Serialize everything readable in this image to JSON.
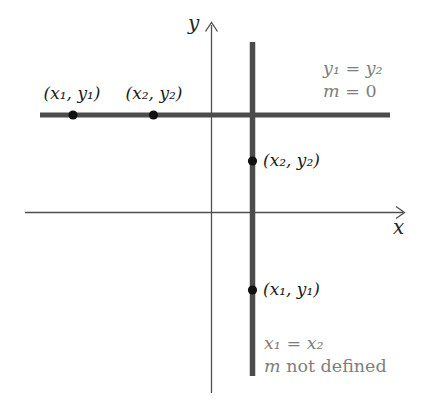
{
  "figure": {
    "colors": {
      "axis": "#4f4f4f",
      "thick_line": "#4c4c4c",
      "dot": "#111111",
      "annotation_text": "#7e7e7e",
      "label_text": "#1c1c1c",
      "background": "#ffffff"
    },
    "axes": {
      "x_label": "x",
      "y_label": "y"
    },
    "horizontal_line": {
      "point1_label": "(x₁, y₁)",
      "point2_label": "(x₂, y₂)",
      "annotation": {
        "eq": "y₁ = y₂",
        "m_var": "m",
        "m_rest": " = 0"
      }
    },
    "vertical_line": {
      "upper_point_label": "(x₂, y₂)",
      "lower_point_label": "(x₁, y₁)",
      "annotation": {
        "eq": "x₁ = x₂",
        "m_var": "m",
        "m_rest": " not defined"
      }
    }
  }
}
